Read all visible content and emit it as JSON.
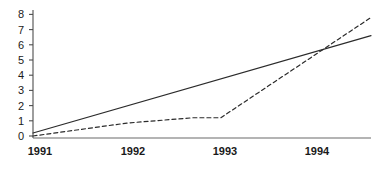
{
  "chart_data": {
    "type": "line",
    "title": "",
    "subtitle": "",
    "xlabel": "",
    "ylabel": "",
    "grid": false,
    "legend": "none",
    "background_color": "#ffffff",
    "axis_color": "#4d4d4d",
    "x": [
      "1991",
      "1992",
      "1993",
      "1994"
    ],
    "xtick_labels": [
      "1991",
      "1992",
      "1993",
      "1994"
    ],
    "ytick_labels": [
      "0",
      "1",
      "2",
      "3",
      "4",
      "5",
      "6",
      "7",
      "8"
    ],
    "ylim": [
      0,
      8
    ],
    "xlim": [
      1991,
      1994.6
    ],
    "series": [
      {
        "name": "solid-series",
        "style": "solid",
        "color": "#2b2b2b",
        "points": [
          {
            "x": 1991.0,
            "y": 0.2
          },
          {
            "x": 1994.6,
            "y": 6.6
          }
        ],
        "values_at_years": [
          0.2,
          2.0,
          3.8,
          5.6
        ]
      },
      {
        "name": "dashed-series",
        "style": "dashed",
        "color": "#2b2b2b",
        "points": [
          {
            "x": 1991.0,
            "y": 0.0
          },
          {
            "x": 1992.0,
            "y": 0.85
          },
          {
            "x": 1992.7,
            "y": 1.2
          },
          {
            "x": 1993.0,
            "y": 1.2
          },
          {
            "x": 1994.6,
            "y": 7.8
          }
        ],
        "values_at_years": [
          0.0,
          0.85,
          1.2,
          5.4
        ]
      }
    ],
    "annotations": []
  },
  "axes": {
    "y_axis_name": "y-axis",
    "x_axis_name": "x-axis"
  }
}
